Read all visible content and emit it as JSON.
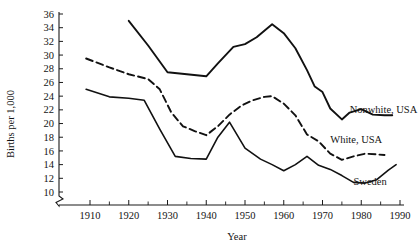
{
  "chart_data": {
    "type": "line",
    "title": "",
    "xlabel": "Year",
    "ylabel": "Births per 1,000",
    "xlim": [
      1905,
      1990
    ],
    "ylim": [
      10,
      36
    ],
    "grid": false,
    "legend_position": "inline-right-end-of-line",
    "axis_break_y": true,
    "x_ticks_major": [
      1910,
      1920,
      1930,
      1940,
      1950,
      1960,
      1970,
      1980,
      1990
    ],
    "x_ticks_minor": [
      1915,
      1925,
      1935,
      1945,
      1955,
      1965,
      1975,
      1985
    ],
    "y_ticks": [
      10,
      12,
      14,
      16,
      18,
      20,
      22,
      24,
      26,
      28,
      30,
      32,
      34,
      36
    ],
    "series": [
      {
        "name": "Nonwhite, USA",
        "style": "solid",
        "stroke_width": 1.9,
        "label_x": 1977,
        "label_y": 21.6,
        "points": [
          [
            1920,
            35.0
          ],
          [
            1925,
            31.4
          ],
          [
            1930,
            27.5
          ],
          [
            1935,
            27.2
          ],
          [
            1940,
            26.9
          ],
          [
            1943,
            28.8
          ],
          [
            1947,
            31.2
          ],
          [
            1950,
            31.6
          ],
          [
            1953,
            32.6
          ],
          [
            1957,
            34.5
          ],
          [
            1960,
            33.2
          ],
          [
            1963,
            31.0
          ],
          [
            1966,
            27.8
          ],
          [
            1968,
            25.4
          ],
          [
            1970,
            24.6
          ],
          [
            1972,
            22.2
          ],
          [
            1975,
            20.6
          ],
          [
            1977,
            21.6
          ],
          [
            1980,
            22.1
          ],
          [
            1983,
            21.3
          ],
          [
            1986,
            21.2
          ],
          [
            1988,
            21.2
          ]
        ]
      },
      {
        "name": "White, USA",
        "style": "dashed",
        "stroke_width": 1.9,
        "dash": "7 4",
        "label_x": 1972,
        "label_y": 17.2,
        "points": [
          [
            1909,
            29.5
          ],
          [
            1915,
            28.2
          ],
          [
            1920,
            27.2
          ],
          [
            1925,
            26.5
          ],
          [
            1928,
            25.0
          ],
          [
            1931,
            21.6
          ],
          [
            1934,
            19.6
          ],
          [
            1937,
            18.9
          ],
          [
            1940,
            18.3
          ],
          [
            1943,
            19.6
          ],
          [
            1946,
            21.3
          ],
          [
            1949,
            22.6
          ],
          [
            1952,
            23.4
          ],
          [
            1955,
            23.9
          ],
          [
            1957,
            24.0
          ],
          [
            1960,
            22.9
          ],
          [
            1963,
            21.2
          ],
          [
            1966,
            18.4
          ],
          [
            1969,
            17.4
          ],
          [
            1972,
            15.6
          ],
          [
            1975,
            14.7
          ],
          [
            1978,
            15.2
          ],
          [
            1981,
            15.6
          ],
          [
            1984,
            15.5
          ],
          [
            1986,
            15.4
          ]
        ]
      },
      {
        "name": "Sweden",
        "style": "solid",
        "stroke_width": 1.6,
        "label_x": 1978,
        "label_y": 11.0,
        "points": [
          [
            1909,
            25.0
          ],
          [
            1915,
            23.9
          ],
          [
            1920,
            23.7
          ],
          [
            1924,
            23.4
          ],
          [
            1928,
            19.2
          ],
          [
            1932,
            15.2
          ],
          [
            1936,
            14.9
          ],
          [
            1940,
            14.8
          ],
          [
            1943,
            18.0
          ],
          [
            1946,
            20.2
          ],
          [
            1950,
            16.4
          ],
          [
            1954,
            14.8
          ],
          [
            1957,
            14.0
          ],
          [
            1960,
            13.1
          ],
          [
            1963,
            14.0
          ],
          [
            1966,
            15.2
          ],
          [
            1969,
            13.9
          ],
          [
            1972,
            13.3
          ],
          [
            1975,
            12.4
          ],
          [
            1978,
            11.4
          ],
          [
            1981,
            11.3
          ],
          [
            1984,
            11.8
          ],
          [
            1987,
            13.2
          ],
          [
            1989,
            14.0
          ]
        ]
      }
    ]
  },
  "axes": {
    "y_title": "Births per 1,000",
    "x_title": "Year",
    "y_tick_labels": [
      "36",
      "34",
      "32",
      "30",
      "28",
      "26",
      "24",
      "22",
      "20",
      "18",
      "16",
      "14",
      "12",
      "10"
    ],
    "x_tick_labels": [
      "1910",
      "1920",
      "1930",
      "1940",
      "1950",
      "1960",
      "1970",
      "1980",
      "1990"
    ]
  },
  "series_labels": {
    "nonwhite_usa": "Nonwhite, USA",
    "white_usa": "White, USA",
    "sweden": "Sweden"
  }
}
